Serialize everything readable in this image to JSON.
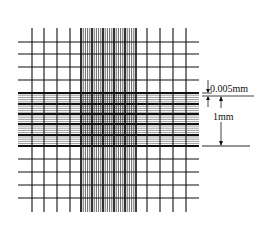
{
  "diagram": {
    "type": "hemocytometer counting grid",
    "colors": {
      "line": "#111111",
      "background": "#ffffff"
    },
    "annotations": {
      "small_spacing_label": "0.005mm",
      "large_spacing_label": "1mm"
    },
    "grid": {
      "x_min": 18,
      "x_max": 199,
      "y_min": 28,
      "y_max": 212,
      "outer_vertical_x": [
        32,
        44,
        57,
        70,
        147,
        160,
        173,
        186
      ],
      "outer_horizontal_y": [
        42,
        54,
        67,
        80,
        159,
        172,
        185,
        198
      ],
      "dense_band_x": [
        81,
        136
      ],
      "dense_band_y": [
        93,
        147
      ],
      "thick_horizontal_y": [
        93,
        104,
        114,
        124,
        135,
        146
      ],
      "thick_vertical_x": [
        81,
        92,
        103,
        114,
        125,
        136
      ]
    }
  }
}
